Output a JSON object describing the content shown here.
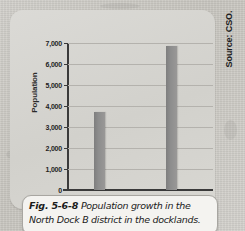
{
  "chart_data": {
    "type": "bar",
    "title": "",
    "xlabel": "",
    "ylabel": "Population",
    "categories": [
      "2006",
      "2011"
    ],
    "values": [
      3700,
      6850
    ],
    "ylim": [
      0,
      7000
    ],
    "ytick_values": [
      0,
      1000,
      2000,
      3000,
      4000,
      5000,
      6000,
      7000
    ],
    "ytick_labels": [
      "0",
      "1,000",
      "2,000",
      "3,000",
      "4,000",
      "5,000",
      "6,000",
      "7,000"
    ],
    "grid": true,
    "legend": "none",
    "bar_color": "#8d8d8d",
    "panel_color": "#d5d3ce"
  },
  "figure": {
    "number_label": "Fig. 5-6-8",
    "caption_line_1": "Population growth in the",
    "caption_line_2": "North Dock B district in the docklands."
  },
  "source": {
    "text": "Source: CSO."
  }
}
